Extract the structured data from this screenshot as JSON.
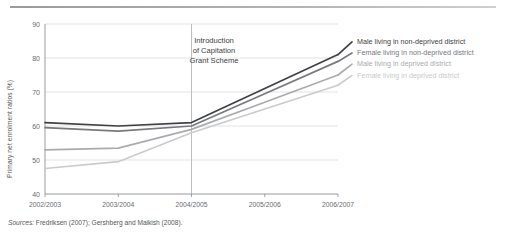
{
  "figure": {
    "top_rule": "horizontal-rule",
    "source_prefix": "Sources:",
    "source_text": " Fredriksen (2007); Gershberg and Maikish (2008)."
  },
  "annotation": {
    "line1": "Introduction",
    "line2": "of Capitation",
    "line3": "Grant Scheme",
    "at_category": "2004/2005"
  },
  "legend": {
    "position": "right",
    "entries": [
      {
        "label": "Male living in non-deprived district",
        "color": "#3f4044"
      },
      {
        "label": "Female living in non-deprived district",
        "color": "#77797d"
      },
      {
        "label": "Male living in deprived district",
        "color": "#a9abae"
      },
      {
        "label": "Female living in deprived district",
        "color": "#c9cbcd"
      }
    ]
  },
  "chart_data": {
    "type": "line",
    "title": "",
    "xlabel": "",
    "ylabel": "Primary net enrolment ratios (%)",
    "categories": [
      "2002/2003",
      "2003/2004",
      "2004/2005",
      "2005/2006",
      "2006/2007"
    ],
    "ylim": [
      40,
      90
    ],
    "yticks": [
      40,
      50,
      60,
      70,
      80,
      90
    ],
    "grid": true,
    "series": [
      {
        "name": "Male living in non-deprived district",
        "color": "#3f4044",
        "values": [
          61.0,
          60.0,
          61.0,
          71.0,
          81.0
        ]
      },
      {
        "name": "Female living in non-deprived district",
        "color": "#77797d",
        "values": [
          59.5,
          58.5,
          60.0,
          69.5,
          79.0
        ]
      },
      {
        "name": "Male living in deprived district",
        "color": "#a9abae",
        "values": [
          53.0,
          53.5,
          59.0,
          67.0,
          75.0
        ]
      },
      {
        "name": "Female living in deprived district",
        "color": "#c9cbcd",
        "values": [
          47.5,
          49.5,
          58.0,
          65.0,
          72.0
        ]
      }
    ]
  }
}
